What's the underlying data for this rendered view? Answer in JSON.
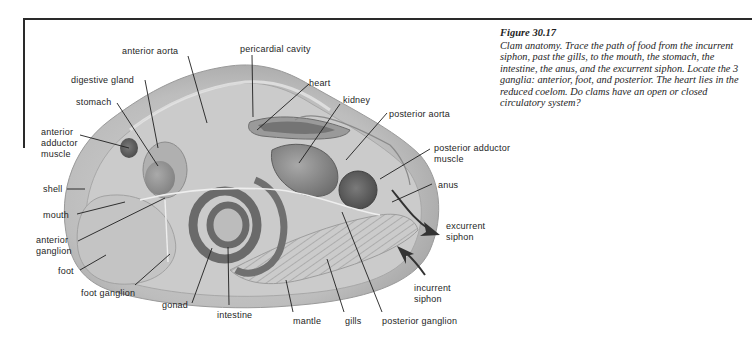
{
  "caption": {
    "figure_number": "Figure 30.17",
    "text": "Clam anatomy. Trace the path of food from the incurrent siphon, past the gills, to the mouth, the stomach, the intestine, the anus, and the excurrent siphon. Locate the 3 ganglia: anterior, foot, and posterior. The heart lies in the reduced coelom. Do clams have an open or closed circulatory system?"
  },
  "labels": {
    "anterior_aorta": "anterior aorta",
    "pericardial_cavity": "pericardial cavity",
    "digestive_gland": "digestive gland",
    "heart": "heart",
    "stomach": "stomach",
    "kidney": "kidney",
    "posterior_aorta": "posterior aorta",
    "anterior_adductor_muscle": "anterior\nadductor\nmuscle",
    "posterior_adductor_muscle": "posterior adductor\nmuscle",
    "shell": "shell",
    "anus": "anus",
    "mouth": "mouth",
    "excurrent_siphon": "excurrent\nsiphon",
    "anterior_ganglion": "anterior\nganglion",
    "foot": "foot",
    "incurrent_siphon": "incurrent\nsiphon",
    "foot_ganglion": "foot ganglion",
    "gonad": "gonad",
    "intestine": "intestine",
    "mantle": "mantle",
    "gills": "gills",
    "posterior_ganglion": "posterior ganglion"
  }
}
